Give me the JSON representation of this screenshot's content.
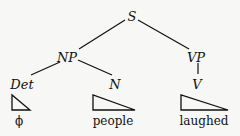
{
  "tree": {
    "nodes": {
      "s": {
        "label": "S"
      },
      "np": {
        "label": "NP"
      },
      "vp": {
        "label": "VP"
      },
      "det": {
        "label": "Det"
      },
      "n": {
        "label": "N"
      },
      "v": {
        "label": "V"
      }
    },
    "leaves": {
      "det": {
        "word": "ϕ"
      },
      "n": {
        "word": "people"
      },
      "v": {
        "word": "laughed"
      }
    },
    "edges": [
      [
        "S",
        "NP"
      ],
      [
        "S",
        "VP"
      ],
      [
        "NP",
        "Det"
      ],
      [
        "NP",
        "N"
      ],
      [
        "VP",
        "V"
      ]
    ]
  }
}
